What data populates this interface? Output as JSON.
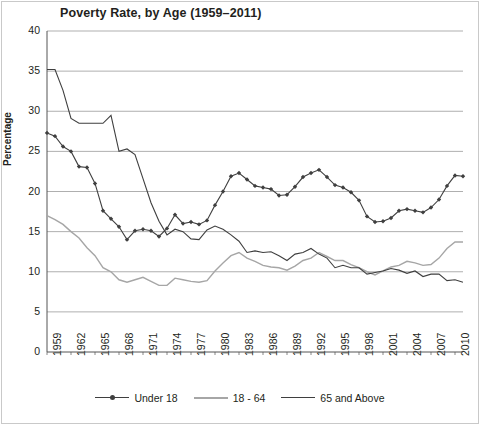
{
  "chart_data": {
    "type": "line",
    "title": "Poverty Rate, by Age (1959–2011)",
    "xlabel": "",
    "ylabel": "Percentage",
    "ylim": [
      0,
      40
    ],
    "yticks": [
      0,
      5,
      10,
      15,
      20,
      25,
      30,
      35,
      40
    ],
    "xlim": [
      1959,
      2011
    ],
    "xticks": [
      "1959",
      "1962",
      "1965",
      "1968",
      "1971",
      "1974",
      "1977",
      "1980",
      "1983",
      "1986",
      "1989",
      "1992",
      "1995",
      "1998",
      "2001",
      "2004",
      "2007",
      "2010"
    ],
    "grid": "horizontal",
    "legend_position": "bottom",
    "x": [
      1959,
      1960,
      1961,
      1962,
      1963,
      1964,
      1965,
      1966,
      1967,
      1968,
      1969,
      1970,
      1971,
      1972,
      1973,
      1974,
      1975,
      1976,
      1977,
      1978,
      1979,
      1980,
      1981,
      1982,
      1983,
      1984,
      1985,
      1986,
      1987,
      1988,
      1989,
      1990,
      1991,
      1992,
      1993,
      1994,
      1995,
      1996,
      1997,
      1998,
      1999,
      2000,
      2001,
      2002,
      2003,
      2004,
      2005,
      2006,
      2007,
      2008,
      2009,
      2010,
      2011
    ],
    "series": [
      {
        "name": "Under 18",
        "color": "#3f3f3f",
        "marker": "diamond",
        "values": [
          27.3,
          26.9,
          25.6,
          25.0,
          23.1,
          23.0,
          21.0,
          17.6,
          16.6,
          15.6,
          14.0,
          15.1,
          15.3,
          15.1,
          14.4,
          15.4,
          17.1,
          16.0,
          16.2,
          15.9,
          16.4,
          18.3,
          20.0,
          21.9,
          22.3,
          21.5,
          20.7,
          20.5,
          20.3,
          19.5,
          19.6,
          20.6,
          21.8,
          22.3,
          22.7,
          21.8,
          20.8,
          20.5,
          19.9,
          18.9,
          16.9,
          16.2,
          16.3,
          16.7,
          17.6,
          17.8,
          17.6,
          17.4,
          18.0,
          19.0,
          20.7,
          22.0,
          21.9
        ]
      },
      {
        "name": "18 - 64",
        "color": "#a6a6a6",
        "marker": "none",
        "values": [
          17.0,
          16.5,
          15.9,
          15.0,
          14.2,
          13.0,
          12.0,
          10.5,
          10.0,
          9.0,
          8.7,
          9.0,
          9.3,
          8.8,
          8.3,
          8.3,
          9.2,
          9.0,
          8.8,
          8.7,
          8.9,
          10.1,
          11.1,
          12.0,
          12.4,
          11.7,
          11.3,
          10.8,
          10.6,
          10.5,
          10.2,
          10.7,
          11.4,
          11.7,
          12.4,
          11.9,
          11.4,
          11.4,
          10.9,
          10.5,
          10.0,
          9.6,
          10.1,
          10.6,
          10.8,
          11.3,
          11.1,
          10.8,
          10.9,
          11.7,
          12.9,
          13.7,
          13.7
        ]
      },
      {
        "name": "65 and Above",
        "color": "#3f3f3f",
        "marker": "none",
        "values": [
          35.2,
          35.2,
          32.6,
          29.1,
          28.5,
          28.5,
          28.5,
          28.5,
          29.5,
          25.0,
          25.3,
          24.6,
          21.6,
          18.6,
          16.3,
          14.6,
          15.3,
          15.0,
          14.1,
          14.0,
          15.2,
          15.7,
          15.3,
          14.6,
          13.8,
          12.4,
          12.6,
          12.4,
          12.5,
          12.0,
          11.4,
          12.2,
          12.4,
          12.9,
          12.2,
          11.7,
          10.5,
          10.8,
          10.5,
          10.5,
          9.7,
          9.9,
          10.1,
          10.4,
          10.2,
          9.8,
          10.1,
          9.4,
          9.7,
          9.7,
          8.9,
          9.0,
          8.7
        ]
      }
    ]
  },
  "legend": {
    "items": [
      {
        "label": "Under 18"
      },
      {
        "label": "18 - 64"
      },
      {
        "label": "65 and Above"
      }
    ]
  }
}
